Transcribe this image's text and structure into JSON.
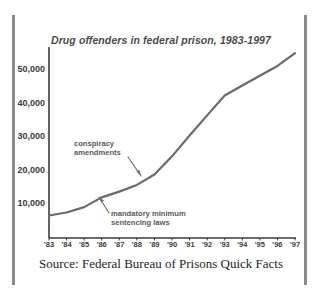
{
  "figure": {
    "width": 322,
    "height": 301,
    "background": "#ffffff",
    "border_bar_color": "#8a8a8a"
  },
  "source_caption": "Source: Federal Bureau of Prisons Quick Facts",
  "chart_data": {
    "type": "line",
    "title": "Drug offenders in federal prison, 1983-1997",
    "xlabel": "",
    "ylabel": "",
    "x": [
      "'83",
      "'84",
      "'85",
      "'86",
      "'87",
      "'88",
      "'89",
      "'90",
      "'91",
      "'92",
      "'93",
      "'94",
      "'95",
      "'96",
      "'97"
    ],
    "values": [
      6700,
      7600,
      9200,
      12100,
      13800,
      15800,
      18900,
      24300,
      30500,
      36500,
      42400,
      45400,
      48300,
      51200,
      55000
    ],
    "series": [
      {
        "name": "Drug offenders in federal prison",
        "values": [
          6700,
          7600,
          9200,
          12100,
          13800,
          15800,
          18900,
          24300,
          30500,
          36500,
          42400,
          45400,
          48300,
          51200,
          55000
        ]
      }
    ],
    "xlim": [
      "'83",
      "'97"
    ],
    "ylim": [
      0,
      56000
    ],
    "yticks": [
      10000,
      20000,
      30000,
      40000,
      50000
    ],
    "ytick_labels": [
      "10,000",
      "20,000",
      "30,000",
      "40,000",
      "50,000"
    ],
    "grid": false,
    "legend": "none",
    "line_color": "#6a6a6a",
    "line_width": 2.2,
    "axis_color": "#3b3b3b",
    "annotations": [
      {
        "id": "conspiracy",
        "line1": "conspiracy",
        "line2": "amendments",
        "points_to_year": "'88",
        "arrow_direction": "down-right"
      },
      {
        "id": "mandatory",
        "line1": "mandatory minimum",
        "line2": "sentencing laws",
        "points_to_year": "'86",
        "arrow_direction": "up-left"
      }
    ]
  }
}
